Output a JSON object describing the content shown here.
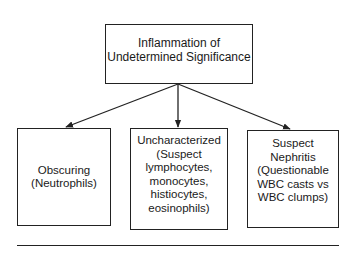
{
  "diagram": {
    "root": {
      "label": "Inflammation of\nUndetermined Significance"
    },
    "children": [
      {
        "label": "Obscuring\n(Neutrophils)"
      },
      {
        "label": "Uncharacterized\n(Suspect\nlymphocytes,\nmonocytes,\nhistiocytes,\neosinophils)"
      },
      {
        "label": "Suspect\nNephritis\n(Questionable\nWBC casts vs\nWBC clumps)"
      }
    ],
    "edges": [
      {
        "from": "root",
        "to": "children.0"
      },
      {
        "from": "root",
        "to": "children.1"
      },
      {
        "from": "root",
        "to": "children.2"
      }
    ],
    "colors": {
      "line": "#222222",
      "background": "#ffffff",
      "text": "#1a1a1a"
    }
  }
}
